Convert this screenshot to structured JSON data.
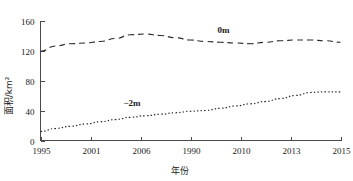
{
  "chart_data": {
    "type": "line",
    "title": "",
    "xlabel": "年份",
    "ylabel": "面积/km²",
    "grid": false,
    "legend_position": "inline-annotation",
    "xlim": [
      1995,
      2015
    ],
    "ylim": [
      0,
      160
    ],
    "yticks": [
      "0",
      "40",
      "80",
      "120",
      "160"
    ],
    "ytick_values": [
      0,
      40,
      80,
      120,
      160
    ],
    "xticks": [
      "1995",
      "2001",
      "2006",
      "1990",
      "2010",
      "2013",
      "2015"
    ],
    "xtick_values": [
      1995,
      2001,
      2006,
      2008,
      2010,
      2013,
      2015
    ],
    "x": [
      1995,
      1996,
      1997,
      1998,
      1999,
      2000,
      2001,
      2002,
      2003,
      2004,
      2005,
      2006,
      2007,
      2008,
      2009,
      2010,
      2011,
      2012,
      2013,
      2014,
      2015
    ],
    "series": [
      {
        "name": "0m",
        "style": "dashed",
        "color": "#2b2b2b",
        "values": [
          119,
          126,
          129,
          130,
          132,
          136,
          141,
          142,
          140,
          137,
          134,
          132,
          131,
          130,
          129,
          131,
          133,
          134,
          134,
          133,
          131
        ]
      },
      {
        "name": "-2m",
        "style": "dotted",
        "color": "#2b2b2b",
        "values": [
          12,
          16,
          19,
          22,
          25,
          28,
          31,
          33,
          35,
          37,
          39,
          40,
          43,
          46,
          49,
          52,
          56,
          60,
          64,
          65,
          65
        ]
      }
    ],
    "annotations": [
      {
        "text": "0m",
        "x": 2007.2,
        "y": 143
      },
      {
        "text": "−2m",
        "x": 2001.1,
        "y": 46
      }
    ]
  },
  "axis": {
    "y_title": "面积/km²",
    "x_title": "年份"
  }
}
